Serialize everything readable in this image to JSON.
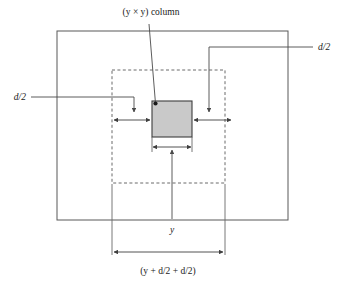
{
  "figure": {
    "title_label": "(y × y) column",
    "labels": {
      "left_gap": "d/2",
      "right_gap": "d/2",
      "column_width": "y",
      "total_width": "(y + d/2 + d/2)"
    },
    "colors": {
      "column_fill": "#c9c9c9",
      "column_stroke": "#3d3d3d",
      "outer_rect_stroke": "#595959",
      "tributary_rect_stroke": "#6b6b6b",
      "dimension_stroke": "#3f3f3f",
      "leader_stroke": "#4a4a4a",
      "text": "#1a1a1a",
      "background": "#ffffff"
    },
    "geometry": {
      "outer_rect": {
        "x": 57,
        "y": 31,
        "width": 231,
        "height": 189
      },
      "tributary_rect": {
        "x": 112,
        "y": 70,
        "width": 113,
        "height": 113
      },
      "column_rect": {
        "x": 152,
        "y": 101,
        "width": 40,
        "height": 36
      }
    },
    "notes": {
      "tributary_boundary_style": "dashed",
      "outer_boundary_style": "solid",
      "column_style": "gray-filled-rectangle"
    }
  }
}
